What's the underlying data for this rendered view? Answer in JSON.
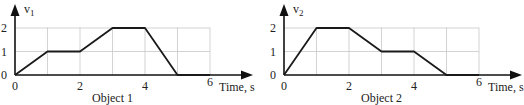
{
  "chart_data": [
    {
      "type": "line",
      "title": "Object 1",
      "xlabel": "Time, s",
      "ylabel": "v1",
      "ylabel_main": "v",
      "ylabel_sub": "1",
      "x": [
        0,
        1,
        2,
        3,
        4,
        5,
        6
      ],
      "values": [
        0,
        1,
        1,
        2,
        2,
        0,
        0
      ],
      "xticks": [
        "0",
        "2",
        "4",
        "6"
      ],
      "yticks": [
        "0",
        "1",
        "2"
      ],
      "xlim": [
        0,
        6
      ],
      "ylim": [
        0,
        2
      ],
      "grid": true
    },
    {
      "type": "line",
      "title": "Object 2",
      "xlabel": "Time, s",
      "ylabel": "v2",
      "ylabel_main": "v",
      "ylabel_sub": "2",
      "x": [
        0,
        1,
        2,
        3,
        4,
        5,
        6
      ],
      "values": [
        0,
        2,
        2,
        1,
        1,
        0,
        0
      ],
      "xticks": [
        "0",
        "2",
        "4",
        "6"
      ],
      "yticks": [
        "0",
        "1",
        "2"
      ],
      "xlim": [
        0,
        6
      ],
      "ylim": [
        0,
        2
      ],
      "grid": true
    }
  ],
  "colors": {
    "line": "#1a1a1a",
    "grid": "#c8c8c8",
    "axis": "#111111"
  }
}
